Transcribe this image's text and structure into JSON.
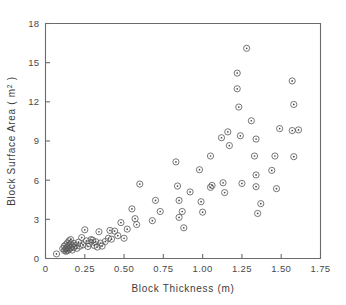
{
  "chart_data": {
    "type": "scatter",
    "title": "",
    "xlabel": "Block Thickness (m)",
    "ylabel": "Block Surface Area (m2)",
    "ylabel_base": "Block Surface Area ( m",
    "ylabel_sup": "2",
    "ylabel_tail": " )",
    "xlim": [
      0,
      1.75
    ],
    "ylim": [
      0,
      18
    ],
    "xticks": [
      0,
      0.25,
      0.5,
      0.75,
      1.0,
      1.25,
      1.5,
      1.75
    ],
    "xtick_labels": [
      "0",
      "0.25",
      "0.50",
      "0.75",
      "1.00",
      "1.25",
      "1.50",
      "1.75"
    ],
    "yticks": [
      0,
      3,
      6,
      9,
      12,
      15,
      18
    ],
    "ytick_labels": [
      "0",
      "3",
      "6",
      "9",
      "12",
      "15",
      "18"
    ],
    "grid": false,
    "legend": null,
    "marker": "circle-with-center-dot",
    "marker_color": "#5f5f5f",
    "points": [
      [
        0.07,
        0.35
      ],
      [
        0.11,
        0.75
      ],
      [
        0.12,
        0.62
      ],
      [
        0.12,
        0.95
      ],
      [
        0.13,
        0.7
      ],
      [
        0.13,
        1.05
      ],
      [
        0.13,
        0.55
      ],
      [
        0.14,
        0.85
      ],
      [
        0.14,
        1.2
      ],
      [
        0.14,
        0.6
      ],
      [
        0.15,
        0.95
      ],
      [
        0.15,
        1.35
      ],
      [
        0.15,
        0.72
      ],
      [
        0.16,
        1.1
      ],
      [
        0.16,
        0.8
      ],
      [
        0.16,
        1.45
      ],
      [
        0.17,
        0.95
      ],
      [
        0.17,
        0.65
      ],
      [
        0.18,
        1.15
      ],
      [
        0.18,
        0.85
      ],
      [
        0.19,
        1.0
      ],
      [
        0.2,
        0.78
      ],
      [
        0.21,
        1.25
      ],
      [
        0.22,
        0.95
      ],
      [
        0.23,
        1.6
      ],
      [
        0.24,
        1.05
      ],
      [
        0.25,
        2.2
      ],
      [
        0.26,
        1.35
      ],
      [
        0.27,
        0.92
      ],
      [
        0.28,
        1.15
      ],
      [
        0.29,
        1.45
      ],
      [
        0.3,
        1.4
      ],
      [
        0.31,
        1.0
      ],
      [
        0.32,
        1.28
      ],
      [
        0.33,
        0.88
      ],
      [
        0.34,
        2.05
      ],
      [
        0.35,
        1.18
      ],
      [
        0.36,
        0.95
      ],
      [
        0.38,
        1.3
      ],
      [
        0.4,
        1.55
      ],
      [
        0.41,
        2.15
      ],
      [
        0.42,
        1.48
      ],
      [
        0.44,
        2.1
      ],
      [
        0.46,
        1.75
      ],
      [
        0.48,
        2.75
      ],
      [
        0.5,
        1.55
      ],
      [
        0.52,
        2.25
      ],
      [
        0.55,
        3.8
      ],
      [
        0.57,
        3.05
      ],
      [
        0.58,
        2.6
      ],
      [
        0.6,
        5.7
      ],
      [
        0.68,
        2.9
      ],
      [
        0.7,
        4.45
      ],
      [
        0.73,
        3.6
      ],
      [
        0.83,
        7.4
      ],
      [
        0.84,
        5.55
      ],
      [
        0.85,
        4.45
      ],
      [
        0.85,
        3.15
      ],
      [
        0.87,
        3.6
      ],
      [
        0.88,
        2.35
      ],
      [
        0.92,
        5.1
      ],
      [
        0.98,
        6.8
      ],
      [
        0.99,
        4.35
      ],
      [
        1.0,
        3.55
      ],
      [
        1.05,
        7.85
      ],
      [
        1.05,
        5.45
      ],
      [
        1.06,
        5.6
      ],
      [
        1.12,
        9.25
      ],
      [
        1.13,
        5.8
      ],
      [
        1.14,
        5.05
      ],
      [
        1.16,
        9.7
      ],
      [
        1.17,
        8.65
      ],
      [
        1.22,
        14.2
      ],
      [
        1.22,
        13.0
      ],
      [
        1.23,
        11.6
      ],
      [
        1.24,
        9.4
      ],
      [
        1.25,
        5.75
      ],
      [
        1.28,
        16.1
      ],
      [
        1.31,
        10.55
      ],
      [
        1.33,
        7.85
      ],
      [
        1.34,
        9.15
      ],
      [
        1.34,
        6.4
      ],
      [
        1.34,
        5.5
      ],
      [
        1.35,
        3.45
      ],
      [
        1.37,
        4.2
      ],
      [
        1.44,
        6.75
      ],
      [
        1.46,
        7.85
      ],
      [
        1.47,
        5.35
      ],
      [
        1.49,
        9.95
      ],
      [
        1.57,
        13.6
      ],
      [
        1.57,
        9.8
      ],
      [
        1.58,
        11.8
      ],
      [
        1.58,
        7.8
      ],
      [
        1.61,
        9.85
      ]
    ]
  },
  "axes": {
    "x_axis_name": "x-axis",
    "y_axis_name": "y-axis"
  }
}
